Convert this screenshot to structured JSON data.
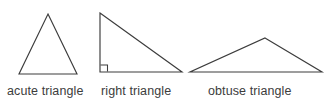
{
  "figure": {
    "width": 329,
    "height": 103,
    "background_color": "#ffffff",
    "stroke_color": "#3c3c3c",
    "text_color": "#3c3c3c"
  },
  "triangles": [
    {
      "id": "acute",
      "label": "acute triangle",
      "shape_name": "acute-triangle-shape",
      "points": "48,14 77,74 19,74",
      "has_right_angle_marker": false,
      "right_angle_marker_path": ""
    },
    {
      "id": "right",
      "label": "right triangle",
      "shape_name": "right-triangle-shape",
      "points": "100,13 182,72 100,72",
      "has_right_angle_marker": true,
      "right_angle_marker_path": "M100.5,65 L107.5,65 L107.5,71.5"
    },
    {
      "id": "obtuse",
      "label": "obtuse triangle",
      "shape_name": "obtuse-triangle-shape",
      "points": "265,38 322,72 190,72",
      "has_right_angle_marker": false,
      "right_angle_marker_path": ""
    }
  ]
}
